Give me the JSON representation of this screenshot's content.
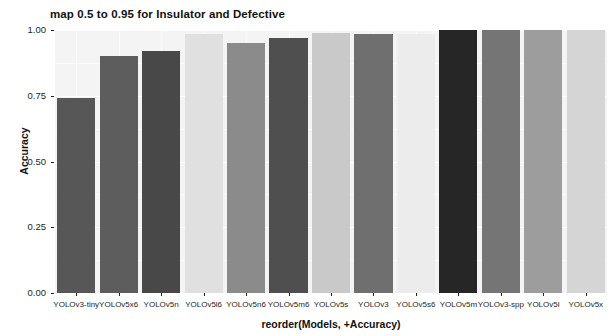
{
  "chart_data": {
    "type": "bar",
    "title": "map 0.5 to 0.95 for Insulator and Defective",
    "xlabel": "reorder(Models, +Accuracy)",
    "ylabel": "Accuracy",
    "ylim": [
      0.0,
      1.0
    ],
    "grid": true,
    "legend": "none",
    "categories": [
      "YOLOv3-tiny",
      "YOLOv5x6",
      "YOLOv5n",
      "YOLOv5l6",
      "YOLOv5n6",
      "YOLOv5m6",
      "YOLOv5s",
      "YOLOv3",
      "YOLOv5s6",
      "YOLOv5m",
      "YOLOv3-spp",
      "YOLOv5l",
      "YOLOv5x"
    ],
    "values": [
      0.74,
      0.9,
      0.92,
      0.985,
      0.95,
      0.97,
      0.99,
      0.985,
      0.985,
      1.0,
      1.0,
      1.0,
      1.0
    ],
    "bar_colors": [
      "#575757",
      "#5d5d5d",
      "#484848",
      "#e0e0e0",
      "#8b8b8b",
      "#4f4f4f",
      "#c9c9c9",
      "#6f6f6f",
      "#ececec",
      "#262626",
      "#757575",
      "#9d9d9d",
      "#d5d5d5"
    ],
    "ytick_values": [
      "0.00",
      "0.25",
      "0.50",
      "0.75",
      "1.00"
    ],
    "ytick_positions": [
      0.0,
      0.25,
      0.5,
      0.75,
      1.0
    ],
    "panel_background": "#f4f4f4",
    "grid_color": "#ffffff"
  }
}
